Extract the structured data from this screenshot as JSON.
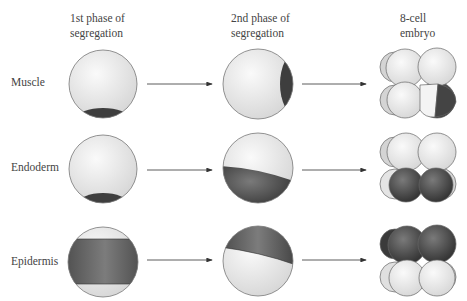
{
  "columns": [
    {
      "line1": "1st phase of",
      "line2": "segregation"
    },
    {
      "line1": "2nd phase of",
      "line2": "segregation"
    },
    {
      "line1": "8-cell",
      "line2": "embryo"
    }
  ],
  "rows": [
    {
      "label": "Muscle"
    },
    {
      "label": "Endoderm"
    },
    {
      "label": "Epidermis"
    }
  ],
  "colors": {
    "light": "#ececec",
    "dark": "#3e3e3e",
    "mid": "#6a6a6a",
    "outline": "#777777",
    "arrow": "#333333"
  }
}
